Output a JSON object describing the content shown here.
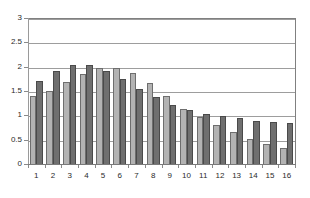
{
  "chart_data": {
    "type": "bar",
    "title": "",
    "subtitle": "",
    "xlabel": "",
    "ylabel": "",
    "ylim": [
      0,
      3
    ],
    "xlim_categories": 16,
    "grid": true,
    "grid_axis": "y",
    "legend": false,
    "legend_position": "none",
    "orientation": "vertical",
    "bar_grouping": "grouped",
    "categories": [
      "1",
      "2",
      "3",
      "4",
      "5",
      "6",
      "7",
      "8",
      "9",
      "10",
      "11",
      "12",
      "13",
      "14",
      "15",
      "16"
    ],
    "ytick_labels": [
      "0",
      "0.5",
      "1",
      "1.5",
      "2",
      "2.5",
      "3"
    ],
    "ytick_values": [
      0,
      0.5,
      1,
      1.5,
      2,
      2.5,
      3
    ],
    "series": [
      {
        "name": "Series 1",
        "color": "#b3b3b3",
        "edge_color": "#6e6e6e",
        "values": [
          1.42,
          1.52,
          1.71,
          1.88,
          2.0,
          2.0,
          1.9,
          1.68,
          1.42,
          1.15,
          0.98,
          0.83,
          0.67,
          0.54,
          0.43,
          0.35
        ]
      },
      {
        "name": "Series 2",
        "color": "#6f6f6f",
        "edge_color": "#4a4a4a",
        "values": [
          1.72,
          1.94,
          2.05,
          2.05,
          1.93,
          1.77,
          1.57,
          1.39,
          1.23,
          1.13,
          1.05,
          1.0,
          0.96,
          0.91,
          0.88,
          0.86
        ]
      }
    ]
  },
  "axes": {
    "y_axis_color": "#9a9a9a",
    "x_axis_color": "#7a7a7a",
    "gridline_color": "#9d9d9d",
    "plot_border_color": "#808080",
    "background": "#ffffff",
    "tick_label_color": "#2b2b2b"
  }
}
